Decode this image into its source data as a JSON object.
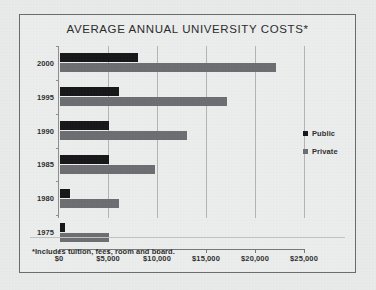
{
  "figure": {
    "title": "AVERAGE ANNUAL UNIVERSITY COSTS*",
    "footnote": "*Includes tuition, fees, room and board."
  },
  "legend": {
    "items": [
      {
        "label": "Public",
        "color": "#17171a",
        "marker": "square-marker"
      },
      {
        "label": "Private",
        "color": "#6d6e71",
        "marker": "square-marker"
      }
    ]
  },
  "chart_data": {
    "type": "bar",
    "orientation": "horizontal",
    "title": "AVERAGE ANNUAL UNIVERSITY COSTS*",
    "xlabel": "",
    "ylabel": "",
    "categories": [
      "2000",
      "1995",
      "1990",
      "1985",
      "1980",
      "1975"
    ],
    "series": [
      {
        "name": "Public",
        "color": "#17171a",
        "values": [
          8000,
          6000,
          5000,
          5000,
          1000,
          500
        ]
      },
      {
        "name": "Private",
        "color": "#6d6e71",
        "values": [
          22000,
          17000,
          13000,
          9700,
          6000,
          5000
        ]
      }
    ],
    "xlim": [
      0,
      25000
    ],
    "xticks": [
      0,
      5000,
      10000,
      15000,
      20000,
      25000
    ],
    "xticklabels": [
      "$0",
      "$5,000",
      "$10,000",
      "$15,000",
      "$20,000",
      "$25,000"
    ],
    "grid": "vertical",
    "legend_position": "right",
    "annotations": [
      "*Includes tuition, fees, room and board."
    ]
  }
}
